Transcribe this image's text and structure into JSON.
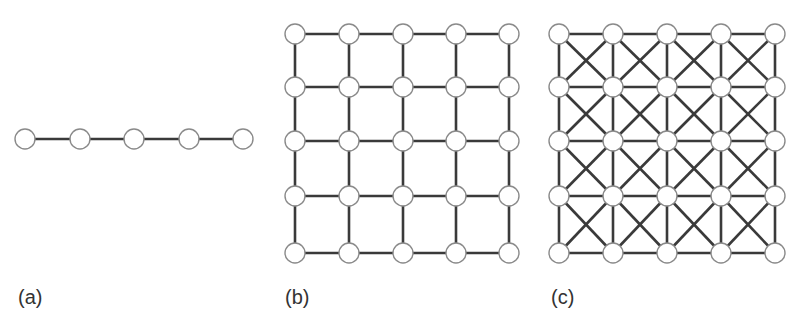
{
  "figure": {
    "panels": [
      {
        "id": "a",
        "label": "(a)",
        "label_pos": [
          18,
          308
        ],
        "topology": "1D chain",
        "rows": 1,
        "cols": 5,
        "xs": [
          25,
          80,
          134,
          189,
          243
        ],
        "ys": [
          139
        ],
        "edges": "horizontal"
      },
      {
        "id": "b",
        "label": "(b)",
        "label_pos": [
          285,
          308
        ],
        "topology": "2D square lattice (4-neighbour)",
        "rows": 5,
        "cols": 5,
        "xs": [
          295,
          349,
          403,
          456,
          509
        ],
        "ys": [
          34,
          87,
          141,
          196,
          253
        ],
        "edges": "orthogonal"
      },
      {
        "id": "c",
        "label": "(c)",
        "label_pos": [
          551,
          308
        ],
        "topology": "2D square lattice with diagonals (8-neighbour)",
        "rows": 5,
        "cols": 5,
        "xs": [
          559,
          613,
          667,
          721,
          775
        ],
        "ys": [
          34,
          87,
          141,
          196,
          253
        ],
        "edges": "orthogonal+diagonal"
      }
    ],
    "style": {
      "node_radius": 10,
      "node_fill": "#ffffff",
      "node_stroke": "#8a8a8a",
      "edge_color": "#3a3a3a",
      "edge_width": 2.6
    }
  }
}
